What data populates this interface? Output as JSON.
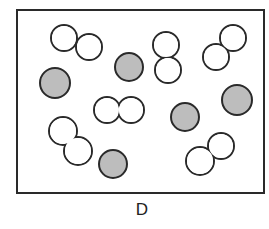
{
  "panel": {
    "label": "D",
    "box": {
      "x": 17,
      "y": 10,
      "width": 247,
      "height": 183
    },
    "colors": {
      "outline": "#2a2a2a",
      "filled": "#bdbdbd",
      "empty": "#ffffff"
    },
    "single_atoms": [
      {
        "cx": 55,
        "cy": 83,
        "r": 15
      },
      {
        "cx": 129,
        "cy": 67,
        "r": 14
      },
      {
        "cx": 237,
        "cy": 100,
        "r": 15
      },
      {
        "cx": 185,
        "cy": 117,
        "r": 14
      },
      {
        "cx": 113,
        "cy": 164,
        "r": 14
      }
    ],
    "diatomic_molecules": [
      {
        "a": {
          "cx": 64,
          "cy": 38,
          "r": 13
        },
        "b": {
          "cx": 89,
          "cy": 47,
          "r": 13
        }
      },
      {
        "a": {
          "cx": 166,
          "cy": 45,
          "r": 13
        },
        "b": {
          "cx": 168,
          "cy": 70,
          "r": 13
        }
      },
      {
        "a": {
          "cx": 233,
          "cy": 38,
          "r": 13
        },
        "b": {
          "cx": 216,
          "cy": 57,
          "r": 13
        }
      },
      {
        "a": {
          "cx": 107,
          "cy": 110,
          "r": 13
        },
        "b": {
          "cx": 131,
          "cy": 110,
          "r": 13
        }
      },
      {
        "a": {
          "cx": 63,
          "cy": 131,
          "r": 14
        },
        "b": {
          "cx": 78,
          "cy": 151,
          "r": 14
        }
      },
      {
        "a": {
          "cx": 221,
          "cy": 146,
          "r": 13
        },
        "b": {
          "cx": 200,
          "cy": 161,
          "r": 14
        }
      }
    ]
  }
}
